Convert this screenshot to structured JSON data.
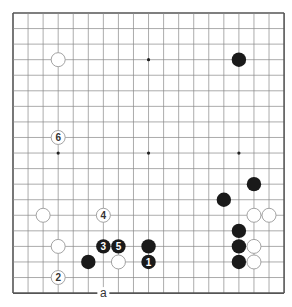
{
  "diagram": {
    "type": "go-board",
    "size": 19,
    "view": "full board",
    "origin_px": {
      "x": 13,
      "y": 13
    },
    "spacing_px": {
      "x": 15.06,
      "y": 15.56
    },
    "colors": {
      "background": "#ffffff",
      "grid": "#888888",
      "border": "#555555",
      "black_stone": "#1a1a1a",
      "white_stone": "#ffffff",
      "white_stone_border": "#999999"
    },
    "star_points": [
      {
        "col": 3,
        "row": 3
      },
      {
        "col": 9,
        "row": 3
      },
      {
        "col": 15,
        "row": 3
      },
      {
        "col": 3,
        "row": 9
      },
      {
        "col": 9,
        "row": 9
      },
      {
        "col": 15,
        "row": 9
      },
      {
        "col": 3,
        "row": 15
      },
      {
        "col": 9,
        "row": 15
      },
      {
        "col": 15,
        "row": 15
      }
    ],
    "stones": [
      {
        "color": "white",
        "col": 3,
        "row": 3,
        "label": ""
      },
      {
        "color": "black",
        "col": 15,
        "row": 3,
        "label": ""
      },
      {
        "color": "white",
        "col": 3,
        "row": 8,
        "label": "6"
      },
      {
        "color": "black",
        "col": 16,
        "row": 11,
        "label": ""
      },
      {
        "color": "black",
        "col": 14,
        "row": 12,
        "label": ""
      },
      {
        "color": "white",
        "col": 2,
        "row": 13,
        "label": ""
      },
      {
        "color": "white",
        "col": 6,
        "row": 13,
        "label": "4"
      },
      {
        "color": "white",
        "col": 16,
        "row": 13,
        "label": ""
      },
      {
        "color": "white",
        "col": 17,
        "row": 13,
        "label": ""
      },
      {
        "color": "black",
        "col": 15,
        "row": 14,
        "label": ""
      },
      {
        "color": "white",
        "col": 3,
        "row": 15,
        "label": ""
      },
      {
        "color": "black",
        "col": 6,
        "row": 15,
        "label": "3"
      },
      {
        "color": "black",
        "col": 7,
        "row": 15,
        "label": "5"
      },
      {
        "color": "black",
        "col": 9,
        "row": 15,
        "label": ""
      },
      {
        "color": "black",
        "col": 15,
        "row": 15,
        "label": ""
      },
      {
        "color": "white",
        "col": 16,
        "row": 15,
        "label": ""
      },
      {
        "color": "black",
        "col": 5,
        "row": 16,
        "label": ""
      },
      {
        "color": "white",
        "col": 7,
        "row": 16,
        "label": ""
      },
      {
        "color": "black",
        "col": 9,
        "row": 16,
        "label": "1"
      },
      {
        "color": "black",
        "col": 15,
        "row": 16,
        "label": ""
      },
      {
        "color": "white",
        "col": 16,
        "row": 16,
        "label": ""
      },
      {
        "color": "white",
        "col": 3,
        "row": 17,
        "label": "2"
      }
    ],
    "markers": [
      {
        "col": 6,
        "row": 18,
        "label": "a"
      }
    ]
  }
}
